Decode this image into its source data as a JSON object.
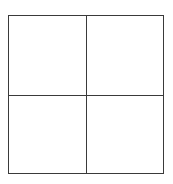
{
  "diagram": {
    "type": "2x2-grid",
    "rows": 2,
    "columns": 2,
    "line_color": "#3a3a3a",
    "background_color": "#ffffff",
    "cells": [
      {
        "position": "top-left",
        "label": ""
      },
      {
        "position": "top-right",
        "label": ""
      },
      {
        "position": "bottom-left",
        "label": ""
      },
      {
        "position": "bottom-right",
        "label": ""
      }
    ]
  }
}
